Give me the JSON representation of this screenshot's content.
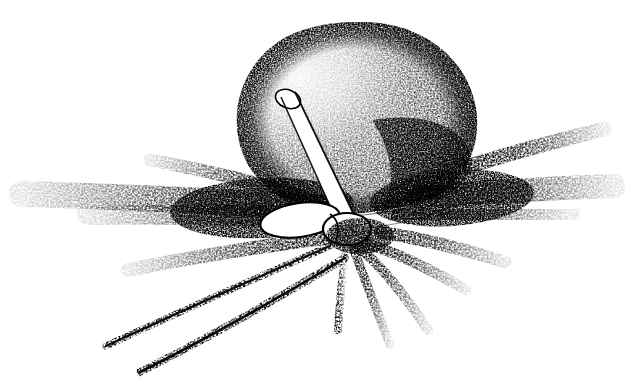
{
  "figure": {
    "domain": "Natural-Image",
    "kind": "stippled-pen-and-ink-scientific-illustration",
    "title": "",
    "caption": "",
    "background_color": "#ffffff",
    "ink_color": "#000000",
    "width": 625,
    "height": 386
  },
  "parts": {
    "body": {
      "name": "cell-body",
      "label": "",
      "shape": "rounded-irregular-sphere",
      "center_x": 358,
      "center_y": 118,
      "radius_x": 120,
      "radius_y": 97,
      "top_y": 22,
      "bottom_y": 215,
      "left_x": 238,
      "right_x": 478,
      "shading": "dense-stipple-darker-on-right-and-lower-right",
      "highlight_x": 300,
      "highlight_y": 75
    },
    "collar": {
      "name": "white-collar-band",
      "label": "",
      "shape": "crescent-white-band",
      "left_x": 243,
      "right_x": 470,
      "y": 190,
      "thickness": 14
    },
    "tube": {
      "name": "white-tubular-appendage",
      "label": "",
      "cap_x": 287,
      "cap_y": 101,
      "base_x": 347,
      "base_y": 222,
      "width": 15
    },
    "knob": {
      "name": "central-attachment-knob",
      "label": "",
      "center_x": 330,
      "center_y": 222,
      "radius_x": 34,
      "radius_y": 17
    },
    "hub": {
      "name": "spicule-hub",
      "center_x": 352,
      "center_y": 232
    }
  },
  "spicules": {
    "name": "radiating-stippled-spicules",
    "count": 11,
    "items": [
      {
        "id": "spicule-left-upper",
        "tip_x": 150,
        "tip_y": 160,
        "ctrl_x": 245,
        "ctrl_y": 182,
        "weight": 0.55
      },
      {
        "id": "spicule-left-1",
        "tip_x": 22,
        "tip_y": 194,
        "ctrl_x": 170,
        "ctrl_y": 196,
        "weight": 1.0
      },
      {
        "id": "spicule-left-2",
        "tip_x": 88,
        "tip_y": 214,
        "ctrl_x": 215,
        "ctrl_y": 210,
        "weight": 0.9
      },
      {
        "id": "spicule-left-3",
        "tip_x": 128,
        "tip_y": 270,
        "ctrl_x": 240,
        "ctrl_y": 244,
        "weight": 0.7
      },
      {
        "id": "spicule-right-upper",
        "tip_x": 604,
        "tip_y": 129,
        "ctrl_x": 500,
        "ctrl_y": 152,
        "weight": 0.75
      },
      {
        "id": "spicule-right-1",
        "tip_x": 614,
        "tip_y": 186,
        "ctrl_x": 500,
        "ctrl_y": 190,
        "weight": 1.0
      },
      {
        "id": "spicule-right-2",
        "tip_x": 570,
        "tip_y": 213,
        "ctrl_x": 470,
        "ctrl_y": 214,
        "weight": 0.85
      },
      {
        "id": "spicule-right-3",
        "tip_x": 505,
        "tip_y": 262,
        "ctrl_x": 440,
        "ctrl_y": 240,
        "weight": 0.7
      },
      {
        "id": "spicule-down-1",
        "tip_x": 466,
        "tip_y": 290,
        "ctrl_x": 412,
        "ctrl_y": 254,
        "weight": 0.6
      },
      {
        "id": "spicule-down-2",
        "tip_x": 428,
        "tip_y": 330,
        "ctrl_x": 392,
        "ctrl_y": 272,
        "weight": 0.55
      },
      {
        "id": "spicule-down-3",
        "tip_x": 390,
        "tip_y": 344,
        "ctrl_x": 368,
        "ctrl_y": 284,
        "weight": 0.5
      }
    ]
  },
  "flagella": {
    "name": "trailing-flagella",
    "count": 2,
    "items": [
      {
        "id": "flagellum-upper",
        "start_x": 330,
        "start_y": 246,
        "ctrl_x": 205,
        "ctrl_y": 300,
        "tip_x": 106,
        "tip_y": 346
      },
      {
        "id": "flagellum-lower",
        "start_x": 345,
        "start_y": 258,
        "ctrl_x": 225,
        "ctrl_y": 330,
        "tip_x": 140,
        "tip_y": 372
      }
    ]
  },
  "artifacts": {
    "name": "scan-artifacts",
    "baseline_y": 378,
    "note": ""
  }
}
